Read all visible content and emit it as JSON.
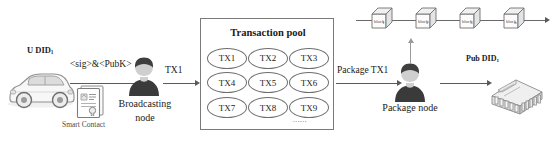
{
  "diagram": {
    "background": "#ffffff",
    "line_color": "#5a5a5a",
    "box_border": "#7a7a7a"
  },
  "user": {
    "icon": "car-icon",
    "label_main": "U DID",
    "label_sub": "1"
  },
  "signature": {
    "label": "<sig>&<PubK>"
  },
  "smart_contract": {
    "icon": "contract-document-icon",
    "label": "Smart Contact"
  },
  "broadcasting_node": {
    "icon": "person-avatar-icon",
    "label_line1": "Broadcasting",
    "label_line2": "node"
  },
  "arrow_tx1": {
    "label": "TX1"
  },
  "transaction_pool": {
    "title": "Transaction pool",
    "transactions": [
      "TX1",
      "TX2",
      "TX3",
      "TX4",
      "TX5",
      "TX6",
      "TX7",
      "TX8",
      "TX9"
    ],
    "ellipsis": "......"
  },
  "arrow_package": {
    "label": "Package TX1"
  },
  "package_node": {
    "icon": "person-avatar-icon",
    "label": "Package node"
  },
  "public_entity": {
    "icon": "institution-building-icon",
    "label_main": "Pub DID",
    "label_sub": "1"
  },
  "blockchain": {
    "blocks": [
      {
        "label": "block",
        "sub": "1"
      },
      {
        "label": "block",
        "sub": "2"
      },
      {
        "label": "block",
        "sub": "3"
      },
      {
        "label": "block",
        "sub": "n"
      }
    ]
  }
}
